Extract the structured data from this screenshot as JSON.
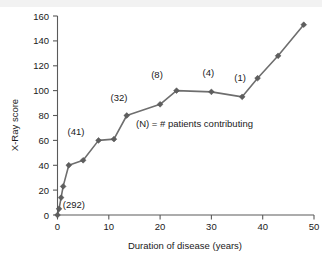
{
  "chart_data": {
    "type": "line",
    "title": "",
    "xlabel": "Duration of disease (years)",
    "ylabel": "X-Ray score",
    "xlim": [
      0,
      50
    ],
    "ylim": [
      0,
      160
    ],
    "grid": false,
    "legend_position": "inside-center-right",
    "xticks": [
      "0",
      "10",
      "20",
      "30",
      "40",
      "50"
    ],
    "xtick_values": [
      0,
      10,
      20,
      30,
      40,
      50
    ],
    "yticks": [
      "0",
      "20",
      "40",
      "60",
      "80",
      "100",
      "120",
      "140",
      "160"
    ],
    "ytick_values": [
      0,
      20,
      40,
      60,
      80,
      100,
      120,
      140,
      160
    ],
    "series": [
      {
        "name": "Mean X-Ray score",
        "marker": "diamond",
        "color": "#5e5e5e",
        "x": [
          0,
          0.3,
          0.7,
          1.1,
          2.2,
          5.0,
          8.0,
          11.0,
          13.5,
          20.0,
          23.2,
          30.0,
          36.0,
          39.0,
          43.0,
          48.0
        ],
        "y": [
          0,
          5,
          14,
          23,
          40,
          44,
          60,
          61,
          80,
          89,
          100,
          99,
          95,
          110,
          128,
          153
        ]
      }
    ],
    "annotations": [
      {
        "text": "(292)",
        "x": 3.2,
        "y": 6,
        "label": "n-292"
      },
      {
        "text": "(41)",
        "x": 3.6,
        "y": 64,
        "label": "n-41"
      },
      {
        "text": "(32)",
        "x": 12.0,
        "y": 92,
        "label": "n-32"
      },
      {
        "text": "(8)",
        "x": 19.4,
        "y": 110,
        "label": "n-8"
      },
      {
        "text": "(4)",
        "x": 29.4,
        "y": 112,
        "label": "n-4"
      },
      {
        "text": "(1)",
        "x": 35.6,
        "y": 108,
        "label": "n-1"
      }
    ],
    "legend_note": "(N) = # patients contributing"
  }
}
